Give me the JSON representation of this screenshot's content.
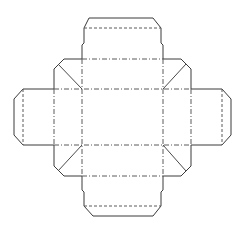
{
  "diagram": {
    "colors": {
      "background": "#ffffff",
      "cut_line": "#3a3a3a",
      "fold_line": "#5a5a5a"
    },
    "legend": {
      "cut": "solid line",
      "valley_fold": "dashed line",
      "mountain_fold": "dash-dot line",
      "gusset": "diagonal line"
    },
    "panels": [
      {
        "name": "base",
        "label": ""
      },
      {
        "name": "top-wall",
        "label": ""
      },
      {
        "name": "bottom-wall",
        "label": ""
      },
      {
        "name": "left-wall",
        "label": ""
      },
      {
        "name": "right-wall",
        "label": ""
      },
      {
        "name": "top-tuck-flap",
        "label": ""
      },
      {
        "name": "bottom-tuck-flap",
        "label": ""
      },
      {
        "name": "left-tuck-flap",
        "label": ""
      },
      {
        "name": "right-tuck-flap",
        "label": ""
      }
    ]
  }
}
